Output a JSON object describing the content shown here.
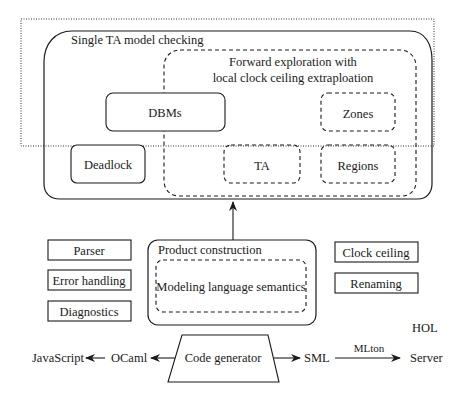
{
  "diagram": {
    "outer_container": {
      "label": "HOL",
      "style": "dotted"
    },
    "single_ta": {
      "title": "Single TA model checking",
      "forward_exploration": {
        "title_line1": "Forward exploration with",
        "title_line2": "local clock ceiling extraploation",
        "zones": "Zones",
        "ta": "TA",
        "regions": "Regions"
      },
      "dbms": "DBMs",
      "deadlock": "Deadlock"
    },
    "left_boxes": [
      "Parser",
      "Error handling",
      "Diagnostics"
    ],
    "product": {
      "title": "Product construction",
      "semantics": "Modeling language semantics"
    },
    "right_boxes": [
      "Clock ceiling",
      "Renaming"
    ],
    "codegen": {
      "label": "Code generator",
      "left_chain": [
        "JavaScript",
        "OCaml"
      ],
      "right_chain": [
        "SML",
        "Server"
      ],
      "mlton_label": "MLton"
    }
  }
}
